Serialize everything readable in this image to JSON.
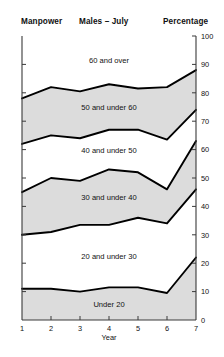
{
  "header": {
    "left_label": "Manpower",
    "center_title": "Males – July",
    "right_label": "Percentage"
  },
  "chart_data": {
    "type": "area",
    "title": "Males – July",
    "subtitle": "",
    "xlabel": "Year",
    "ylabel": "Percentage",
    "left_axis_label": "Manpower",
    "x": [
      1,
      2,
      3,
      4,
      5,
      6,
      7
    ],
    "xtick_labels": [
      "1",
      "2",
      "3",
      "4",
      "5",
      "6",
      "7"
    ],
    "xlim": [
      1,
      7
    ],
    "ylim": [
      0,
      100
    ],
    "ytick_labels": [
      "0",
      "10",
      "20",
      "30",
      "40",
      "50",
      "60",
      "70",
      "80",
      "90",
      "100"
    ],
    "ytick_values": [
      0,
      10,
      20,
      30,
      40,
      50,
      60,
      70,
      80,
      90,
      100
    ],
    "grid": false,
    "legend": "inline-band-labels",
    "stacked": true,
    "shaded_fill": "#dcdcdc",
    "unshaded_fill": "#ffffff",
    "line_color": "#000000",
    "series": [
      {
        "name": "Under 20",
        "shaded": true,
        "cumulative_top": [
          11,
          11,
          10,
          11.5,
          11.5,
          9.5,
          22
        ],
        "values": [
          11,
          11,
          10,
          11.5,
          11.5,
          9.5,
          22
        ]
      },
      {
        "name": "20 and under 30",
        "shaded": false,
        "cumulative_top": [
          30,
          31,
          33.5,
          33.5,
          36,
          34,
          46
        ],
        "values": [
          19,
          20,
          23.5,
          22,
          24.5,
          24.5,
          24
        ]
      },
      {
        "name": "30 and under 40",
        "shaded": true,
        "cumulative_top": [
          45,
          50,
          49,
          53,
          52,
          46,
          63
        ],
        "values": [
          15,
          19,
          15.5,
          19.5,
          16,
          12,
          17
        ]
      },
      {
        "name": "40 and under 50",
        "shaded": false,
        "cumulative_top": [
          62,
          65,
          64,
          67,
          67,
          63.5,
          74
        ],
        "values": [
          17,
          15,
          15,
          14,
          15,
          17.5,
          11
        ]
      },
      {
        "name": "50 and under 60",
        "shaded": true,
        "cumulative_top": [
          78,
          82,
          80.5,
          83,
          81.5,
          82,
          88
        ],
        "values": [
          16,
          17,
          16.5,
          16,
          14.5,
          18.5,
          14
        ]
      },
      {
        "name": "60 and over",
        "shaded": false,
        "cumulative_top": [
          100,
          100,
          100,
          100,
          100,
          100,
          100
        ],
        "values": [
          22,
          18,
          19.5,
          17,
          18.5,
          18,
          12
        ]
      }
    ]
  }
}
